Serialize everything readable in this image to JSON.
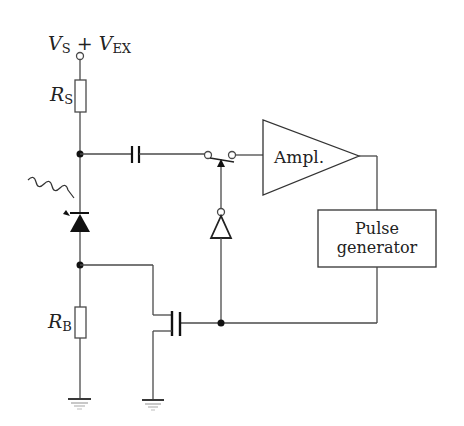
{
  "diagram": {
    "type": "circuit-schematic",
    "colors": {
      "line": "#4a4a4a",
      "text": "#222222",
      "background": "#ffffff"
    },
    "labels": {
      "supply_main": "V",
      "supply_sub1": "S",
      "supply_plus": " + ",
      "supply_main2": "V",
      "supply_sub2": "EX",
      "rs_main": "R",
      "rs_sub": "S",
      "rb_main": "R",
      "rb_sub": "B",
      "amplifier": "Ampl.",
      "pulse_line1": "Pulse",
      "pulse_line2": "generator"
    },
    "components": [
      {
        "id": "supply-terminal",
        "label": "V_S + V_EX"
      },
      {
        "id": "resistor-rs",
        "label": "R_S"
      },
      {
        "id": "coupling-capacitor"
      },
      {
        "id": "photodiode",
        "note": "illuminated by wavy light arrow"
      },
      {
        "id": "resistor-rb",
        "label": "R_B"
      },
      {
        "id": "switch"
      },
      {
        "id": "inverter"
      },
      {
        "id": "amplifier",
        "label": "Ampl."
      },
      {
        "id": "pulse-generator",
        "label": "Pulse generator"
      },
      {
        "id": "fet-transistor"
      },
      {
        "id": "ground-left"
      },
      {
        "id": "ground-right"
      }
    ]
  }
}
